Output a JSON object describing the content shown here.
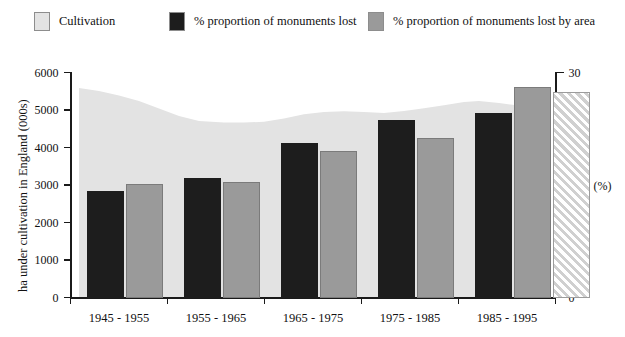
{
  "legend": {
    "items": [
      {
        "label": "Cultivation",
        "color": "#e3e3e3",
        "pattern": "solid"
      },
      {
        "label": "% proportion of monuments lost",
        "color": "#1d1d1d",
        "pattern": "solid"
      },
      {
        "label": "% proportion of monuments lost by area",
        "color": "#9a9a9a",
        "pattern": "solid"
      }
    ]
  },
  "axes": {
    "left_title": "ha under cultivation in England (000s)",
    "left_ticks": [
      "0",
      "1000",
      "2000",
      "3000",
      "4000",
      "5000",
      "6000"
    ],
    "right_ticks": [
      "0",
      "5",
      "10",
      "15",
      "20",
      "25",
      "30"
    ],
    "right_unit": "(%)"
  },
  "chart_data": {
    "type": "bar",
    "title": "",
    "xlabel": "",
    "ylabel": "ha under cultivation in England (000s)",
    "y2label": "(%)",
    "ylim": [
      0,
      6000
    ],
    "y2lim": [
      0,
      30
    ],
    "grid": false,
    "legend_position": "top",
    "categories": [
      "1945 - 1955",
      "1955 - 1965",
      "1965 - 1975",
      "1975 - 1985",
      "1985 - 1995"
    ],
    "series": [
      {
        "name": "% proportion of monuments lost",
        "axis": "right",
        "color": "#1d1d1d",
        "values": [
          14.3,
          16.0,
          20.7,
          23.7,
          24.7
        ]
      },
      {
        "name": "% proportion of monuments lost by area",
        "axis": "right",
        "color": "#9a9a9a",
        "values": [
          15.2,
          15.5,
          19.6,
          21.3,
          28.2
        ]
      },
      {
        "name": "projected",
        "axis": "right",
        "color": "#d0d0d0",
        "pattern": "diagonal-hatch",
        "values": [
          null,
          null,
          null,
          null,
          27.5
        ]
      }
    ],
    "area_series": {
      "name": "Cultivation",
      "axis": "left",
      "color": "#e3e3e3",
      "points": [
        [
          0,
          5600
        ],
        [
          20,
          5520
        ],
        [
          40,
          5400
        ],
        [
          60,
          5250
        ],
        [
          80,
          5050
        ],
        [
          100,
          4850
        ],
        [
          120,
          4720
        ],
        [
          145,
          4680
        ],
        [
          165,
          4680
        ],
        [
          185,
          4700
        ],
        [
          205,
          4790
        ],
        [
          225,
          4900
        ],
        [
          245,
          4960
        ],
        [
          265,
          4980
        ],
        [
          285,
          4960
        ],
        [
          305,
          4930
        ],
        [
          325,
          4990
        ],
        [
          345,
          5060
        ],
        [
          365,
          5140
        ],
        [
          385,
          5230
        ],
        [
          400,
          5250
        ],
        [
          420,
          5200
        ],
        [
          440,
          5130
        ],
        [
          460,
          5040
        ],
        [
          480,
          4970
        ],
        [
          500,
          4930
        ],
        [
          520,
          4910
        ],
        [
          540,
          4900
        ],
        [
          560,
          4900
        ]
      ]
    }
  }
}
